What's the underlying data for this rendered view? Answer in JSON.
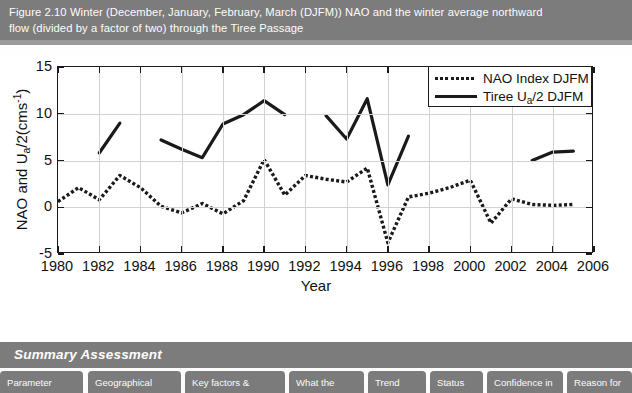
{
  "caption": {
    "text": "Figure 2.10 Winter (December, January, February, March (DJFM)) NAO and the winter average northward\nflow (divided by a factor of two) through the Tiree Passage"
  },
  "summary": {
    "banner_label": "Summary Assessment",
    "columns": [
      "Parameter",
      "Geographical",
      "Key factors &",
      "What the",
      "Trend",
      "Status",
      "Confidence in",
      "Reason for"
    ]
  },
  "legend": {
    "position": "top-right",
    "entries": [
      {
        "label": "NAO Index DJFM",
        "style": "dotted",
        "color": "#1a1a1a"
      },
      {
        "label_pre": "Tiree U",
        "label_sub": "a",
        "label_post": "/2 DJFM",
        "style": "solid",
        "color": "#1a1a1a"
      }
    ]
  },
  "axes": {
    "x_title": "Year",
    "y_title_pre": "NAO and U",
    "y_title_sub": "a",
    "y_title_mid": "/2(cms",
    "y_title_sup": "-1",
    "y_title_post": ")",
    "x_ticks": [
      "1980",
      "1982",
      "1984",
      "1986",
      "1988",
      "1990",
      "1992",
      "1994",
      "1996",
      "1998",
      "2000",
      "2002",
      "2004",
      "2006"
    ],
    "y_ticks": [
      "15",
      "10",
      "5",
      "0",
      "-5"
    ]
  },
  "chart_data": {
    "type": "line",
    "xlabel": "Year",
    "ylabel": "NAO and Ua/2 (cms-1)",
    "xlim": [
      1980,
      2006
    ],
    "ylim": [
      -5,
      15
    ],
    "xtick_interval": 2,
    "ytick_interval": 5,
    "grid": true,
    "legend_position": "top-right",
    "x": [
      1980,
      1981,
      1982,
      1983,
      1984,
      1985,
      1986,
      1987,
      1988,
      1989,
      1990,
      1991,
      1992,
      1993,
      1994,
      1995,
      1996,
      1997,
      1998,
      1999,
      2000,
      2001,
      2002,
      2003,
      2004,
      2005
    ],
    "series": [
      {
        "name": "NAO Index DJFM",
        "style": "dotted",
        "color": "#1a1a1a",
        "values": [
          0.6,
          2.1,
          0.8,
          3.4,
          2.1,
          0.1,
          -0.6,
          0.4,
          -0.7,
          0.7,
          5.1,
          1.3,
          3.4,
          3.0,
          2.7,
          4.2,
          -3.8,
          1.1,
          1.5,
          2.1,
          2.9,
          -1.7,
          0.9,
          0.3,
          0.2,
          0.3
        ]
      },
      {
        "name": "Tiree Ua/2 DJFM",
        "style": "solid",
        "color": "#1a1a1a",
        "note": "discontinuous record - four separate segments with data gaps",
        "segments": [
          {
            "x": [
              1982,
              1983
            ],
            "values": [
              5.8,
              9.0
            ]
          },
          {
            "x": [
              1985,
              1986,
              1987,
              1988,
              1989,
              1990,
              1991
            ],
            "values": [
              7.2,
              6.2,
              5.3,
              8.9,
              9.9,
              11.4,
              9.9
            ]
          },
          {
            "x": [
              1993,
              1994,
              1995,
              1996,
              1997
            ],
            "values": [
              9.8,
              7.3,
              11.6,
              2.4,
              7.6
            ]
          },
          {
            "x": [
              2003,
              2004,
              2005
            ],
            "values": [
              5.0,
              5.9,
              6.0
            ]
          }
        ]
      }
    ]
  },
  "colors": {
    "banner_gray": "#7d7d7d",
    "banner_text": "#ffffff",
    "plot_ink": "#1a1a1a",
    "gridline": "#d2d2d2"
  }
}
